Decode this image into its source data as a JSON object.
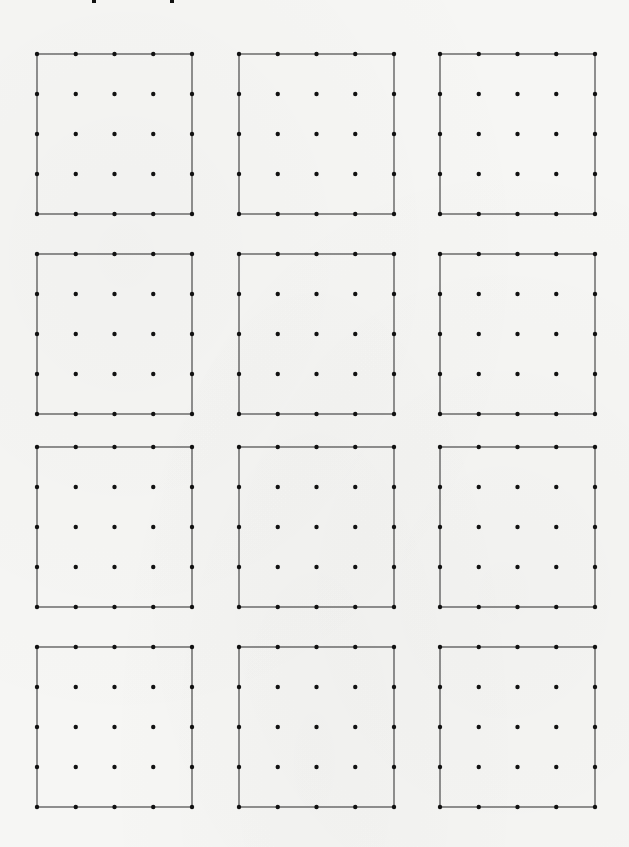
{
  "worksheet": {
    "type": "geoboard-dot-grid",
    "grid": {
      "rows": 4,
      "columns": 3,
      "dots_per_side": 5
    },
    "title_remnants": [
      {
        "x": 92
      },
      {
        "x": 170
      }
    ],
    "column_x": [
      37,
      239,
      440
    ],
    "row_y": [
      54,
      254,
      447,
      647
    ],
    "board_width": 155,
    "board_height": 160,
    "colors": {
      "background": "#f6f6f4",
      "border_line": "#4a4a4a",
      "dot": "#111111"
    },
    "boards": [
      {
        "id": "board-1-1",
        "row": 1,
        "col": 1
      },
      {
        "id": "board-1-2",
        "row": 1,
        "col": 2
      },
      {
        "id": "board-1-3",
        "row": 1,
        "col": 3
      },
      {
        "id": "board-2-1",
        "row": 2,
        "col": 1
      },
      {
        "id": "board-2-2",
        "row": 2,
        "col": 2
      },
      {
        "id": "board-2-3",
        "row": 2,
        "col": 3
      },
      {
        "id": "board-3-1",
        "row": 3,
        "col": 1
      },
      {
        "id": "board-3-2",
        "row": 3,
        "col": 2
      },
      {
        "id": "board-3-3",
        "row": 3,
        "col": 3
      },
      {
        "id": "board-4-1",
        "row": 4,
        "col": 1
      },
      {
        "id": "board-4-2",
        "row": 4,
        "col": 2
      },
      {
        "id": "board-4-3",
        "row": 4,
        "col": 3
      }
    ]
  }
}
